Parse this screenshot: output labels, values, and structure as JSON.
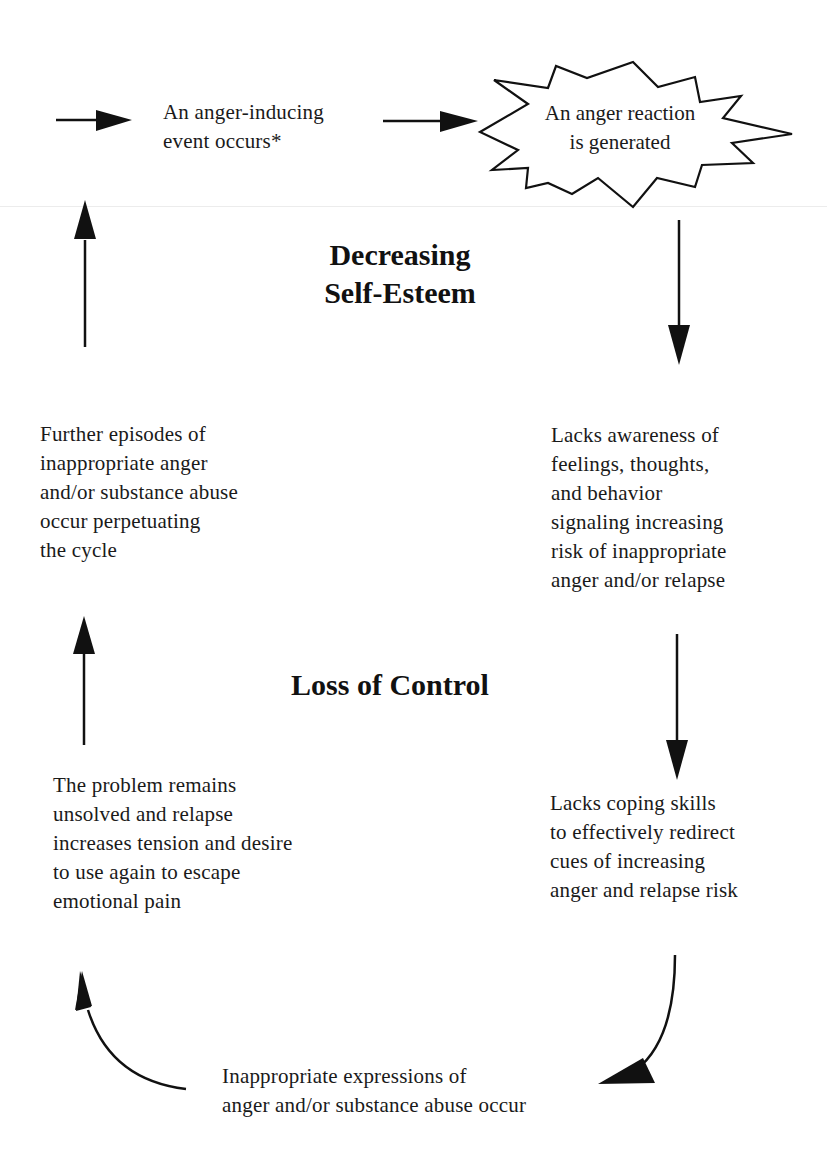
{
  "diagram": {
    "type": "cycle-flowchart",
    "center_labels": {
      "top": "Decreasing\nSelf-Esteem",
      "middle": "Loss of Control"
    },
    "nodes": [
      {
        "id": "event",
        "text": "An anger-inducing\nevent occurs*"
      },
      {
        "id": "reaction",
        "text": "An anger reaction\nis generated",
        "shape": "starburst"
      },
      {
        "id": "awareness",
        "text": "Lacks awareness of\nfeelings, thoughts,\nand behavior\nsignaling increasing\nrisk of inappropriate\nanger and/or relapse"
      },
      {
        "id": "coping",
        "text": "Lacks coping skills\nto effectively redirect\ncues of increasing\nanger and relapse risk"
      },
      {
        "id": "expression",
        "text": "Inappropriate expressions of\nanger and/or substance abuse occur"
      },
      {
        "id": "unsolved",
        "text": "The problem remains\nunsolved and relapse\nincreases tension and desire\nto use again to escape\nemotional pain"
      },
      {
        "id": "further",
        "text": "Further episodes of\ninappropriate anger\nand/or substance abuse\noccur perpetuating\nthe cycle"
      }
    ],
    "edges": [
      {
        "from": "entry",
        "to": "event",
        "direction": "right"
      },
      {
        "from": "event",
        "to": "reaction",
        "direction": "right"
      },
      {
        "from": "reaction",
        "to": "awareness",
        "direction": "down"
      },
      {
        "from": "awareness",
        "to": "coping",
        "direction": "down"
      },
      {
        "from": "coping",
        "to": "expression",
        "direction": "curved-down-left"
      },
      {
        "from": "expression",
        "to": "unsolved",
        "direction": "curved-up-left"
      },
      {
        "from": "unsolved",
        "to": "further",
        "direction": "up"
      },
      {
        "from": "further",
        "to": "event",
        "direction": "up"
      }
    ],
    "colors": {
      "ink": "#1a1a1a",
      "background": "#ffffff"
    }
  }
}
